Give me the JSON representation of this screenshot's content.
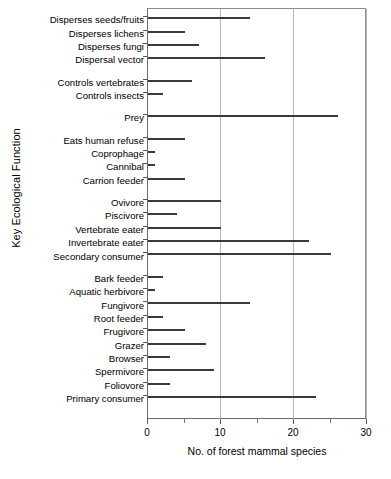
{
  "chart_data": {
    "type": "bar",
    "orientation": "horizontal",
    "title": "",
    "xlabel": "No. of  forest mammal species",
    "ylabel": "Key Ecological Function",
    "xlim": [
      0,
      30
    ],
    "xticks": [
      0,
      10,
      20,
      30
    ],
    "xticklabels": [
      "0",
      "10",
      "20",
      "30"
    ],
    "xminorticks": [
      5,
      15,
      25
    ],
    "grid": true,
    "grid_axis": "x",
    "legend": null,
    "bar_color": "#4a4a4a",
    "categories": [
      "Disperses seeds/fruits",
      "Disperses lichens",
      "Disperses fungi",
      "Dispersal vector",
      "Controls vertebrates",
      "Controls insects",
      "Prey",
      "Eats human refuse",
      "Coprophage",
      "Cannibal",
      "Carrion feeder",
      "Ovivore",
      "Piscivore",
      "Vertebrate  eater",
      "Invertebrate  eater",
      "Secondary consumer",
      "Bark  feeder",
      "Aquatic herbivore",
      "Fungivore",
      "Root feeder",
      "Frugivore",
      "Grazer",
      "Browser",
      "Spermivore",
      "Foliovore",
      "Primary consumer"
    ],
    "values": [
      14,
      5,
      7,
      16,
      6,
      2,
      26,
      5,
      1,
      1,
      5,
      10,
      4,
      10,
      22,
      25,
      2,
      1,
      14,
      2,
      5,
      8,
      3,
      9,
      3,
      23
    ],
    "group_breaks_after": [
      3,
      5,
      6,
      10,
      15
    ]
  }
}
